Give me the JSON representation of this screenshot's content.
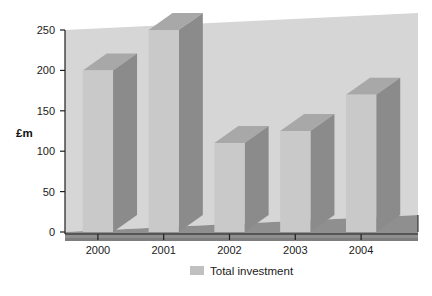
{
  "chart_data": {
    "type": "bar",
    "title": "",
    "subtitle": "",
    "xlabel": "",
    "ylabel": "£m",
    "categories": [
      "2000",
      "2001",
      "2002",
      "2003",
      "2004"
    ],
    "values": [
      200,
      250,
      110,
      125,
      170
    ],
    "series": [
      {
        "name": "Total investment",
        "values": [
          200,
          250,
          110,
          125,
          170
        ]
      }
    ],
    "ylim": [
      0,
      250
    ],
    "ytick_labels": [
      "0",
      "50",
      "100",
      "150",
      "200",
      "250"
    ],
    "ytick_values": [
      0,
      50,
      100,
      150,
      200,
      250
    ],
    "grid": false,
    "style": "3d-bar",
    "legend": {
      "position": "bottom",
      "entries": [
        "Total investment"
      ]
    },
    "annotations": []
  },
  "axes": {
    "y_title": "£m",
    "y_ticks": [
      "250",
      "200",
      "150",
      "100",
      "50",
      "0"
    ],
    "x_ticks": [
      "2000",
      "2001",
      "2002",
      "2003",
      "2004"
    ]
  },
  "legend": {
    "swatch_name": "legend-color-swatch",
    "label": "Total investment"
  },
  "colors": {
    "background": "#ffffff",
    "wall": "#d6d6d6",
    "wall_top": "#cfcfcf",
    "floor": "#8f8f8f",
    "floor_front": "#7e7e7e",
    "bar_front": "#c9c9c9",
    "bar_side": "#8b8b8b",
    "bar_top": "#a8a8a8",
    "axis": "#1f1f1f",
    "text": "#1a1a1a",
    "legend_swatch": "#c0c0c0"
  }
}
